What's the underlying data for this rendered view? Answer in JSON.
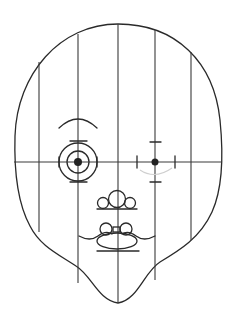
{
  "diagram": {
    "type": "face-proportion-grid",
    "colors": {
      "ink": "#2a2a2a",
      "background": "#ffffff"
    },
    "head_outline": {
      "top": [
        118,
        24
      ],
      "left_x": 14,
      "right_x": 222,
      "chin": [
        118,
        303
      ]
    },
    "grid": {
      "vertical_lines_x": [
        39,
        78,
        118,
        155,
        191
      ],
      "horizontal_line_y": 162
    },
    "left_eye": {
      "center": [
        78,
        162
      ],
      "rings": [
        10,
        18
      ],
      "style": "concentric-target"
    },
    "left_brow": {
      "from": [
        59,
        126
      ],
      "to": [
        97,
        126
      ],
      "peak_y": 118
    },
    "right_eye": {
      "center": [
        155,
        162
      ],
      "style": "crosshair-ticks"
    },
    "nose": {
      "circles": [
        [
          103,
          202,
          6
        ],
        [
          117,
          198,
          8
        ],
        [
          130,
          202,
          6
        ]
      ],
      "base_y": 209
    },
    "mouth": {
      "circles": [
        [
          106,
          229,
          6
        ],
        [
          126,
          229,
          6
        ]
      ],
      "lip_ellipse": [
        117,
        240,
        19,
        8
      ],
      "base_y": 251
    }
  }
}
